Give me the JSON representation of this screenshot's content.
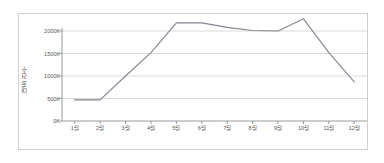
{
  "chart_data": {
    "type": "line",
    "title": "",
    "xlabel": "",
    "ylabel": "대출 건수",
    "categories": [
      "1월",
      "2월",
      "3월",
      "4월",
      "5월",
      "6월",
      "7월",
      "8월",
      "9월",
      "10월",
      "11월",
      "12월"
    ],
    "values": [
      470000,
      470000,
      1000000,
      1520000,
      2180000,
      2180000,
      2080000,
      2010000,
      2000000,
      2270000,
      1520000,
      870000
    ],
    "series": [
      {
        "name": "대출 건수",
        "values": [
          470000,
          470000,
          1000000,
          1520000,
          2180000,
          2180000,
          2080000,
          2010000,
          2000000,
          2270000,
          1520000,
          870000
        ],
        "color": "#8a7f8f"
      }
    ],
    "ylim": [
      0,
      2500000
    ],
    "y_ticks": [
      0,
      500000,
      1000000,
      1500000,
      2000000
    ],
    "y_tick_labels": [
      "0K",
      "500K",
      "1000K",
      "1500K",
      "2000K"
    ],
    "grid": true,
    "grid_color": "#c8c8c8",
    "legend": false,
    "legend_position": "none",
    "axis_color": "#808080",
    "border_color": "#d0d0d0",
    "background": "#ffffff"
  }
}
